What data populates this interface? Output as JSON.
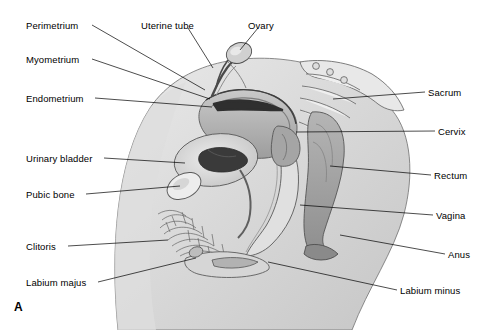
{
  "figure": {
    "panel_letter": "A",
    "background_color": "#ffffff",
    "line_color": "#000000",
    "tissue_colors": {
      "outline_body": "#cfcfcf",
      "uterus_fill": "#b9b9b9",
      "uterus_dark": "#8f8f8f",
      "endometrium_dark": "#3a3a3a",
      "bladder_fill": "#d8d8d8",
      "rectum_fill": "#a8a8a8",
      "bone_fill": "#e4e4e4",
      "pubic_hair": "#6b6b6b"
    }
  },
  "labels_left": [
    {
      "id": "perimetrium",
      "text": "Perimetrium",
      "x": 26,
      "y": 20,
      "leader": [
        [
          92,
          25
        ],
        [
          205,
          90
        ]
      ]
    },
    {
      "id": "myometrium",
      "text": "Myometrium",
      "x": 26,
      "y": 54,
      "leader": [
        [
          92,
          59
        ],
        [
          210,
          99
        ]
      ]
    },
    {
      "id": "endometrium",
      "text": "Endometrium",
      "x": 26,
      "y": 93,
      "leader": [
        [
          95,
          98
        ],
        [
          212,
          107
        ]
      ]
    },
    {
      "id": "urinary-bladder",
      "text": "Urinary bladder",
      "x": 26,
      "y": 153,
      "leader": [
        [
          104,
          158
        ],
        [
          185,
          163
        ]
      ]
    },
    {
      "id": "pubic-bone",
      "text": "Pubic bone",
      "x": 26,
      "y": 189,
      "leader": [
        [
          86,
          194
        ],
        [
          180,
          186
        ]
      ]
    },
    {
      "id": "clitoris",
      "text": "Clitoris",
      "x": 26,
      "y": 241,
      "leader": [
        [
          68,
          246
        ],
        [
          168,
          240
        ]
      ]
    },
    {
      "id": "labium-majus",
      "text": "Labium majus",
      "x": 26,
      "y": 277,
      "leader": [
        [
          98,
          282
        ],
        [
          196,
          258
        ]
      ]
    }
  ],
  "labels_top": [
    {
      "id": "uterine-tube",
      "text": "Uterine tube",
      "x": 141,
      "y": 20,
      "leader": [
        [
          188,
          28
        ],
        [
          213,
          68
        ]
      ]
    },
    {
      "id": "ovary",
      "text": "Ovary",
      "x": 248,
      "y": 20,
      "leader": [
        [
          258,
          28
        ],
        [
          240,
          50
        ]
      ]
    }
  ],
  "labels_right": [
    {
      "id": "sacrum",
      "text": "Sacrum",
      "x": 428,
      "y": 87,
      "leader": [
        [
          425,
          92
        ],
        [
          333,
          99
        ]
      ]
    },
    {
      "id": "cervix",
      "text": "Cervix",
      "x": 438,
      "y": 126,
      "leader": [
        [
          435,
          131
        ],
        [
          296,
          132
        ]
      ]
    },
    {
      "id": "rectum",
      "text": "Rectum",
      "x": 434,
      "y": 170,
      "leader": [
        [
          431,
          175
        ],
        [
          330,
          166
        ]
      ]
    },
    {
      "id": "vagina",
      "text": "Vagina",
      "x": 436,
      "y": 210,
      "leader": [
        [
          433,
          215
        ],
        [
          300,
          205
        ]
      ]
    },
    {
      "id": "anus",
      "text": "Anus",
      "x": 448,
      "y": 249,
      "leader": [
        [
          445,
          254
        ],
        [
          340,
          235
        ]
      ]
    },
    {
      "id": "labium-minus",
      "text": "Labium minus",
      "x": 400,
      "y": 285,
      "leader": [
        [
          397,
          290
        ],
        [
          268,
          262
        ]
      ]
    }
  ]
}
